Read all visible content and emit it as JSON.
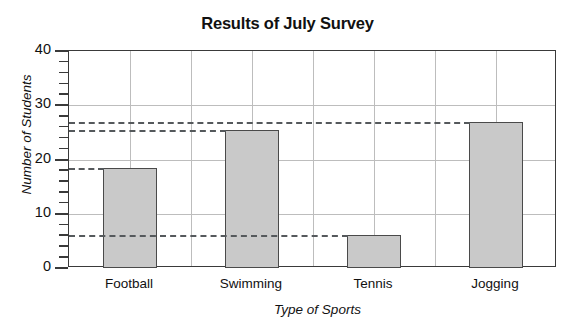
{
  "chart_data": {
    "type": "bar",
    "title": "Results of July Survey",
    "xlabel": "Type of Sports",
    "ylabel": "Number of Students",
    "categories": [
      "Football",
      "Swimming",
      "Tennis",
      "Jogging"
    ],
    "values": [
      18.5,
      25.5,
      6,
      27
    ],
    "ylim": [
      0,
      40
    ],
    "yticks": [
      0,
      10,
      20,
      30,
      40
    ],
    "ytick_labels": [
      "0",
      "10",
      "20",
      "30",
      "40"
    ],
    "minor_tick_step": 2,
    "grid": "horizontal-and-vertical",
    "legend": "none",
    "bar_fill_color": "#c9c9c9",
    "bar_edge_color": "#4a4a4a",
    "gridline_color": "#bdbdbd",
    "axis_color": "#3a3a3a",
    "reference_lines": {
      "style": "dashed",
      "color": "#55595c",
      "values": [
        27,
        25.5,
        18.5,
        6
      ]
    }
  }
}
